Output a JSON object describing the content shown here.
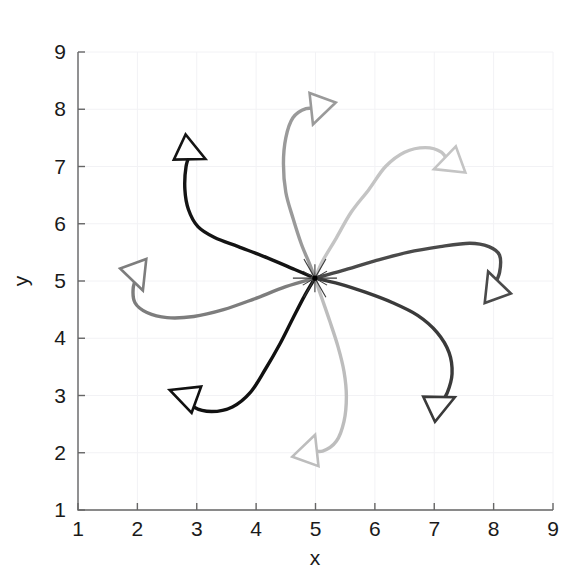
{
  "figure": {
    "title": "",
    "background_color": "#ffffff"
  },
  "chart_data": {
    "type": "line",
    "title": "",
    "xlabel": "x",
    "ylabel": "y",
    "xlim": [
      1,
      9
    ],
    "ylim": [
      1,
      9
    ],
    "xticks": [
      1,
      2,
      3,
      4,
      5,
      6,
      7,
      8,
      9
    ],
    "yticks": [
      1,
      2,
      3,
      4,
      5,
      6,
      7,
      8,
      9
    ],
    "xtick_labels": [
      "1",
      "2",
      "3",
      "4",
      "5",
      "6",
      "7",
      "8",
      "9"
    ],
    "ytick_labels": [
      "1",
      "2",
      "3",
      "4",
      "5",
      "6",
      "7",
      "8",
      "9"
    ],
    "grid": true,
    "grid_color": "#f2f2f5",
    "legend": "none",
    "axis_color": "#666666",
    "rendezvous_point": {
      "x": 4.99,
      "y": 5.05,
      "marker": "star",
      "color": "#3a3a3a"
    },
    "series": [
      {
        "name": "agent-1",
        "color": "#141414",
        "linewidth": 3.4,
        "start": {
          "x": 2.9,
          "y": 7.25
        },
        "end": {
          "x": 4.99,
          "y": 5.05
        },
        "marker": "triangle",
        "marker_rotation_deg": 115,
        "path": [
          [
            2.9,
            7.25
          ],
          [
            2.82,
            7.0
          ],
          [
            2.8,
            6.6
          ],
          [
            2.86,
            6.25
          ],
          [
            3.02,
            5.95
          ],
          [
            3.3,
            5.76
          ],
          [
            3.7,
            5.6
          ],
          [
            4.2,
            5.4
          ],
          [
            4.65,
            5.2
          ],
          [
            4.99,
            5.05
          ]
        ]
      },
      {
        "name": "agent-2",
        "color": "#9a9a9a",
        "linewidth": 3.4,
        "start": {
          "x": 5.05,
          "y": 8.0
        },
        "end": {
          "x": 4.99,
          "y": 5.05
        },
        "marker": "triangle",
        "marker_rotation_deg": 200,
        "path": [
          [
            5.05,
            8.0
          ],
          [
            4.84,
            8.01
          ],
          [
            4.62,
            7.85
          ],
          [
            4.5,
            7.5
          ],
          [
            4.46,
            7.05
          ],
          [
            4.5,
            6.55
          ],
          [
            4.62,
            6.1
          ],
          [
            4.76,
            5.65
          ],
          [
            4.9,
            5.3
          ],
          [
            4.99,
            5.05
          ]
        ]
      },
      {
        "name": "agent-3",
        "color": "#c4c4c4",
        "linewidth": 3.4,
        "start": {
          "x": 7.25,
          "y": 7.05
        },
        "end": {
          "x": 4.99,
          "y": 5.05
        },
        "marker": "triangle",
        "marker_rotation_deg": 250,
        "path": [
          [
            7.25,
            7.05
          ],
          [
            7.12,
            7.25
          ],
          [
            6.85,
            7.33
          ],
          [
            6.5,
            7.25
          ],
          [
            6.18,
            7.0
          ],
          [
            5.9,
            6.6
          ],
          [
            5.6,
            6.2
          ],
          [
            5.35,
            5.75
          ],
          [
            5.12,
            5.35
          ],
          [
            4.99,
            5.05
          ]
        ]
      },
      {
        "name": "agent-4",
        "color": "#4a4a4a",
        "linewidth": 3.4,
        "start": {
          "x": 8.0,
          "y": 4.9
        },
        "end": {
          "x": 4.99,
          "y": 5.05
        },
        "marker": "triangle",
        "marker_rotation_deg": 340,
        "path": [
          [
            8.0,
            4.9
          ],
          [
            8.1,
            5.15
          ],
          [
            8.1,
            5.45
          ],
          [
            7.92,
            5.6
          ],
          [
            7.6,
            5.66
          ],
          [
            7.1,
            5.6
          ],
          [
            6.55,
            5.5
          ],
          [
            6.0,
            5.35
          ],
          [
            5.45,
            5.18
          ],
          [
            4.99,
            5.05
          ]
        ]
      },
      {
        "name": "agent-5",
        "color": "#3a3a3a",
        "linewidth": 3.4,
        "start": {
          "x": 7.1,
          "y": 2.85
        },
        "end": {
          "x": 4.99,
          "y": 5.05
        },
        "marker": "triangle",
        "marker_rotation_deg": 65,
        "path": [
          [
            7.1,
            2.85
          ],
          [
            7.22,
            3.05
          ],
          [
            7.3,
            3.38
          ],
          [
            7.25,
            3.75
          ],
          [
            7.05,
            4.1
          ],
          [
            6.72,
            4.4
          ],
          [
            6.3,
            4.62
          ],
          [
            5.85,
            4.8
          ],
          [
            5.4,
            4.95
          ],
          [
            4.99,
            5.05
          ]
        ]
      },
      {
        "name": "agent-6",
        "color": "#bdbdbd",
        "linewidth": 3.4,
        "start": {
          "x": 4.9,
          "y": 2.05
        },
        "end": {
          "x": 4.99,
          "y": 5.05
        },
        "marker": "triangle",
        "marker_rotation_deg": 20,
        "path": [
          [
            4.9,
            2.05
          ],
          [
            5.12,
            2.03
          ],
          [
            5.35,
            2.2
          ],
          [
            5.48,
            2.55
          ],
          [
            5.52,
            2.98
          ],
          [
            5.48,
            3.42
          ],
          [
            5.38,
            3.85
          ],
          [
            5.24,
            4.3
          ],
          [
            5.1,
            4.72
          ],
          [
            4.99,
            5.05
          ]
        ]
      },
      {
        "name": "agent-7",
        "color": "#111111",
        "linewidth": 3.4,
        "start": {
          "x": 2.8,
          "y": 3.0
        },
        "end": {
          "x": 4.99,
          "y": 5.05
        },
        "marker": "triangle",
        "marker_rotation_deg": 290,
        "path": [
          [
            2.8,
            3.0
          ],
          [
            2.95,
            2.8
          ],
          [
            3.25,
            2.72
          ],
          [
            3.6,
            2.8
          ],
          [
            3.9,
            3.05
          ],
          [
            4.15,
            3.45
          ],
          [
            4.4,
            3.9
          ],
          [
            4.62,
            4.35
          ],
          [
            4.82,
            4.75
          ],
          [
            4.99,
            5.05
          ]
        ]
      },
      {
        "name": "agent-8",
        "color": "#7d7d7d",
        "linewidth": 3.4,
        "start": {
          "x": 2.0,
          "y": 5.1
        },
        "end": {
          "x": 4.99,
          "y": 5.05
        },
        "marker": "triangle",
        "marker_rotation_deg": 160,
        "path": [
          [
            2.0,
            5.1
          ],
          [
            1.93,
            4.88
          ],
          [
            1.96,
            4.62
          ],
          [
            2.16,
            4.45
          ],
          [
            2.5,
            4.36
          ],
          [
            2.95,
            4.38
          ],
          [
            3.45,
            4.5
          ],
          [
            3.95,
            4.68
          ],
          [
            4.5,
            4.9
          ],
          [
            4.99,
            5.05
          ]
        ]
      }
    ]
  }
}
